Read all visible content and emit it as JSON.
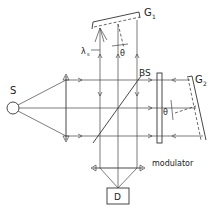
{
  "diagram": {
    "title": "",
    "labels": {
      "source": "S",
      "grating1": "G",
      "grating1_sub": "1",
      "grating2": "G",
      "grating2_sub": "2",
      "beamsplitter": "BS",
      "lambda": "λ",
      "lambda_sub": "s",
      "theta1": "θ",
      "theta2": "θ",
      "modulator": "modulator",
      "detector": "D"
    },
    "components": [
      {
        "id": "S",
        "type": "source"
      },
      {
        "id": "lens1",
        "type": "lens"
      },
      {
        "id": "BS",
        "type": "beamsplitter"
      },
      {
        "id": "G1",
        "type": "grating"
      },
      {
        "id": "G2",
        "type": "grating"
      },
      {
        "id": "modulator",
        "type": "modulator"
      },
      {
        "id": "lens2",
        "type": "lens"
      },
      {
        "id": "D",
        "type": "detector"
      }
    ]
  }
}
